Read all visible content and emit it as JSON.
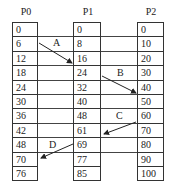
{
  "columns": [
    {
      "header": "P0",
      "values": [
        "0",
        "6",
        "12",
        "18",
        "24",
        "30",
        "36",
        "42",
        "48",
        "70",
        "76"
      ]
    },
    {
      "header": "P1",
      "values": [
        "0",
        "8",
        "16",
        "24",
        "32",
        "40",
        "48",
        "61",
        "69",
        "77",
        "85"
      ]
    },
    {
      "header": "P2",
      "values": [
        "0",
        "10",
        "20",
        "30",
        "40",
        "50",
        "60",
        "70",
        "80",
        "90",
        "100"
      ]
    }
  ],
  "arrows": [
    {
      "label": "A",
      "from": "P0:6",
      "to": "P1:16"
    },
    {
      "label": "B",
      "from": "P1:24",
      "to": "P2:40"
    },
    {
      "label": "C",
      "from": "P2:60",
      "to": "P1:61"
    },
    {
      "label": "D",
      "from": "P1:69",
      "to": "P0:70"
    }
  ]
}
